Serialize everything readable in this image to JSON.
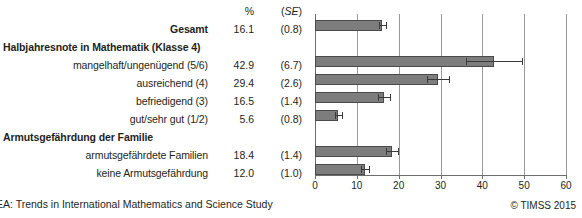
{
  "header": {
    "pct_label": "%",
    "se_label_open": "(",
    "se_label": "SE",
    "se_label_close": ")"
  },
  "footer": {
    "source": "EA: Trends in International Mathematics and Science Study",
    "copyright": "© TIMSS 2015"
  },
  "rows": [
    {
      "label": "Gesamt",
      "bold": true,
      "heading": false,
      "pct": "16.1",
      "se": "(0.8)",
      "value": 16.1,
      "se_value": 0.8
    },
    {
      "label": "Halbjahresnote in Mathematik (Klasse 4)",
      "bold": true,
      "heading": true,
      "pct": "",
      "se": "",
      "value": null,
      "se_value": null
    },
    {
      "label": "mangelhaft/ungenügend (5/6)",
      "bold": false,
      "heading": false,
      "pct": "42.9",
      "se": "(6.7)",
      "value": 42.9,
      "se_value": 6.7
    },
    {
      "label": "ausreichend (4)",
      "bold": false,
      "heading": false,
      "pct": "29.4",
      "se": "(2.6)",
      "value": 29.4,
      "se_value": 2.6
    },
    {
      "label": "befriedigend (3)",
      "bold": false,
      "heading": false,
      "pct": "16.5",
      "se": "(1.4)",
      "value": 16.5,
      "se_value": 1.4
    },
    {
      "label": "gut/sehr gut (1/2)",
      "bold": false,
      "heading": false,
      "pct": "5.6",
      "se": "(0.8)",
      "value": 5.6,
      "se_value": 0.8
    },
    {
      "label": "Armutsgefährdung der Familie",
      "bold": true,
      "heading": true,
      "pct": "",
      "se": "",
      "value": null,
      "se_value": null
    },
    {
      "label": "armutsgefährdete Familien",
      "bold": false,
      "heading": false,
      "pct": "18.4",
      "se": "(1.4)",
      "value": 18.4,
      "se_value": 1.4
    },
    {
      "label": "keine Armutsgefährdung",
      "bold": false,
      "heading": false,
      "pct": "12.0",
      "se": "(1.0)",
      "value": 12.0,
      "se_value": 1.0
    }
  ],
  "chart_data": {
    "type": "bar",
    "orientation": "horizontal",
    "title": "",
    "xlabel": "",
    "ylabel": "",
    "xlim": [
      0,
      60
    ],
    "xticks": [
      0,
      10,
      20,
      30,
      40,
      50,
      60
    ],
    "xticklabels": [
      "0",
      "10",
      "20",
      "30",
      "40",
      "50",
      "60"
    ],
    "grid": true,
    "legend": null,
    "categories": [
      "Gesamt",
      "mangelhaft/ungenügend (5/6)",
      "ausreichend (4)",
      "befriedigend (3)",
      "gut/sehr gut (1/2)",
      "armutsgefährdete Familien",
      "keine Armutsgefährdung"
    ],
    "values": [
      16.1,
      42.9,
      29.4,
      16.5,
      5.6,
      18.4,
      12.0
    ],
    "errors": [
      0.8,
      6.7,
      2.6,
      1.4,
      0.8,
      1.4,
      1.0
    ],
    "bar_color": "#7d7d7d",
    "error_color": "#3a3a3a"
  }
}
